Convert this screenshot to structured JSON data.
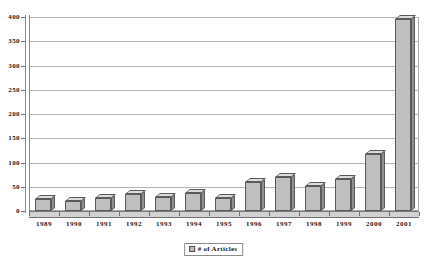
{
  "chart_data": {
    "type": "bar",
    "title": "",
    "subtitle": "",
    "xlabel": "",
    "ylabel": "",
    "categories": [
      "1989",
      "1990",
      "1991",
      "1992",
      "1993",
      "1994",
      "1995",
      "1996",
      "1997",
      "1998",
      "1999",
      "2000",
      "2001"
    ],
    "values": [
      25,
      20,
      27,
      35,
      28,
      38,
      27,
      60,
      70,
      52,
      67,
      118,
      395
    ],
    "series": [
      {
        "name": "# of Articles",
        "values": [
          25,
          20,
          27,
          35,
          28,
          38,
          27,
          60,
          70,
          52,
          67,
          118,
          395
        ]
      }
    ],
    "ylim": [
      0,
      400
    ],
    "ytick_values": [
      0,
      50,
      100,
      150,
      200,
      250,
      300,
      350,
      400
    ],
    "ytick_labels": [
      "0",
      "50",
      "100",
      "150",
      "200",
      "250",
      "300",
      "350",
      "400"
    ],
    "grid": true,
    "grid_axis": "y",
    "legend_position": "bottom",
    "legend_entries": [
      "# of Articles"
    ],
    "style": "3d-bar"
  },
  "legend": {
    "label": "# of Articles",
    "swatch_name": "series-color-swatch"
  },
  "colors": {
    "bar_front": "#bfbfbf",
    "bar_top": "#dcdcdc",
    "bar_side": "#8f8f8f",
    "bar_outline": "#5a5a5a",
    "gridline": "#b4b4b4",
    "axis": "#6e6e6e",
    "plot_background": "#ffffff",
    "text": "#1a1a1a"
  }
}
